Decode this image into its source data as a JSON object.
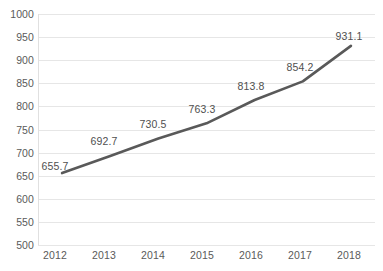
{
  "chart_data": {
    "type": "line",
    "title": "",
    "subtitle": "",
    "xlabel": "",
    "ylabel": "",
    "categories": [
      "2012",
      "2013",
      "2014",
      "2015",
      "2016",
      "2017",
      "2018"
    ],
    "values": [
      655.7,
      692.7,
      730.5,
      763.3,
      813.8,
      854.2,
      931.1
    ],
    "point_labels": [
      "655.7",
      "692.7",
      "730.5",
      "763.3",
      "813.8",
      "854.2",
      "931.1"
    ],
    "series": [
      {
        "name": "",
        "values": [
          655.7,
          692.7,
          730.5,
          763.3,
          813.8,
          854.2,
          931.1
        ]
      }
    ],
    "ylim": [
      500,
      1000
    ],
    "ytick_step": 50,
    "ytick_labels": [
      "1000",
      "950",
      "900",
      "850",
      "800",
      "750",
      "700",
      "650",
      "600",
      "550",
      "500"
    ],
    "ytick_values": [
      1000,
      950,
      900,
      850,
      800,
      750,
      700,
      650,
      600,
      550,
      500
    ],
    "grid": {
      "horizontal": true,
      "vertical": false,
      "color": "#e6e6e6"
    },
    "legend": {
      "visible": false,
      "position": "none",
      "entries": []
    },
    "colors": {
      "line": "#595959",
      "background": "#ffffff",
      "text": "#5a5a5a",
      "gridline": "#e6e6e6",
      "axis": "#e0e0e0"
    },
    "line_width": 2.6,
    "markers": false
  }
}
